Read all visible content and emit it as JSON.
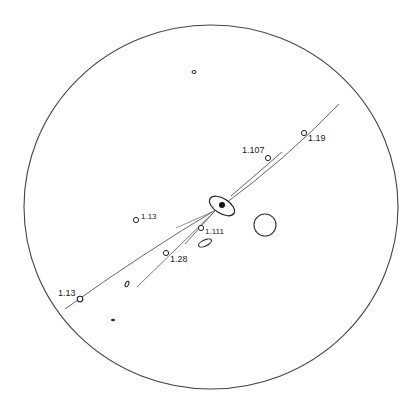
{
  "diagram": {
    "type": "stereographic projection",
    "colors": {
      "stroke": "#333333",
      "background": "#ffffff"
    },
    "labels": {
      "p1_119": "1.19",
      "p1_107": "1.107",
      "p1_13a": "1.13",
      "p1_111": "1.111",
      "p1_28": "1.28",
      "p1_13b": "1.13"
    }
  }
}
